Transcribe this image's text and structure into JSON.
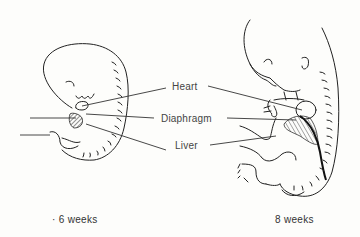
{
  "figure": {
    "labels": {
      "heart": "Heart",
      "diaphragm": "Diaphragm",
      "liver": "Liver"
    },
    "captions": {
      "left": "· 6 weeks",
      "right": "8 weeks"
    }
  }
}
